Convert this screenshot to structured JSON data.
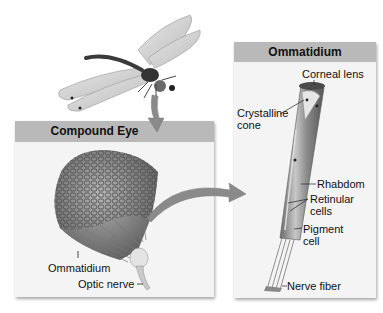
{
  "figure": {
    "illustration": "dragonfly"
  },
  "panels": {
    "compound_eye": {
      "title": "Compound Eye",
      "labels": {
        "ommatidium": "Ommatidium",
        "optic_nerve": "Optic nerve"
      }
    },
    "ommatidium": {
      "title": "Ommatidium",
      "labels": {
        "corneal_lens": "Corneal lens",
        "crystalline_cone_1": "Crystalline",
        "crystalline_cone_2": "cone",
        "rhabdom": "Rhabdom",
        "retinular_cells_1": "Retinular",
        "retinular_cells_2": "cells",
        "pigment_cell_1": "Pigment",
        "pigment_cell_2": "cell",
        "nerve_fiber": "Nerve fiber"
      }
    }
  },
  "colors": {
    "header_bg": "#b9b9b9",
    "panel_bg": "#f4f4f4",
    "arrow": "#8a8a8a"
  }
}
